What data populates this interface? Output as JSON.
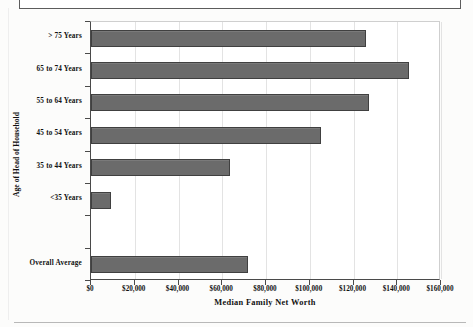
{
  "page": {
    "background_color": "#fcfcfb",
    "artifact_note": "partial-textbox-border"
  },
  "chart_data": {
    "type": "bar",
    "orientation": "horizontal",
    "title": "",
    "subtitle": "",
    "xlabel": "Median Family Net Worth",
    "ylabel": "Age of Head of Household",
    "categories": [
      "> 75 Years",
      "65 to 74 Years",
      "55 to 64 Years",
      "45 to 54 Years",
      "35 to 44 Years",
      "<35 Years",
      "",
      "Overall Average"
    ],
    "values": [
      125700,
      145400,
      127000,
      105100,
      63500,
      9100,
      0,
      71800
    ],
    "xlim": [
      0,
      160000
    ],
    "ylim_categories": 8,
    "xticks": [
      0,
      20000,
      40000,
      60000,
      80000,
      100000,
      120000,
      140000,
      160000
    ],
    "xticklabels": [
      "$0",
      "$20,000",
      "$40,000",
      "$60,000",
      "$80,000",
      "$100,000",
      "$120,000",
      "$140,000",
      "$160,000"
    ],
    "grid": true,
    "grid_axis": "x",
    "legend": false,
    "legend_position": "none",
    "bar_color": "#6b6b6b",
    "bar_edge_color": "#404040",
    "axis_color": "#4a4a4a",
    "gridline_color": "#e3e3e3",
    "plot_background": "#ffffff"
  }
}
